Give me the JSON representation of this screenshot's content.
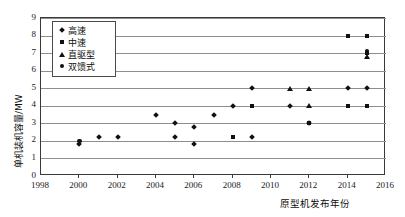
{
  "chart_data": {
    "type": "scatter",
    "title": "",
    "xlabel": "原型机发布年份",
    "ylabel": "单机装机容量/MW",
    "xlim": [
      1998,
      2016
    ],
    "ylim": [
      0,
      9
    ],
    "xticks": [
      1998,
      2000,
      2002,
      2004,
      2006,
      2008,
      2010,
      2012,
      2014,
      2016
    ],
    "yticks": [
      0,
      1,
      2,
      3,
      4,
      5,
      6,
      7,
      8,
      9
    ],
    "grid": true,
    "legend_position": "top-left",
    "series": [
      {
        "name": "高速",
        "marker": "diamond",
        "points": [
          {
            "x": 2000,
            "y": 1.8
          },
          {
            "x": 2001,
            "y": 2.2
          },
          {
            "x": 2002,
            "y": 2.2
          },
          {
            "x": 2004,
            "y": 3.5
          },
          {
            "x": 2005,
            "y": 3.0
          },
          {
            "x": 2005,
            "y": 2.2
          },
          {
            "x": 2006,
            "y": 2.8
          },
          {
            "x": 2006,
            "y": 1.8
          },
          {
            "x": 2007,
            "y": 3.5
          },
          {
            "x": 2008,
            "y": 4.0
          },
          {
            "x": 2009,
            "y": 5.0
          },
          {
            "x": 2009,
            "y": 2.2
          },
          {
            "x": 2011,
            "y": 4.0
          },
          {
            "x": 2012,
            "y": 3.0
          },
          {
            "x": 2014,
            "y": 5.0
          },
          {
            "x": 2015,
            "y": 5.0
          }
        ]
      },
      {
        "name": "中速",
        "marker": "square",
        "points": [
          {
            "x": 2008,
            "y": 2.2
          },
          {
            "x": 2009,
            "y": 4.0
          },
          {
            "x": 2012,
            "y": 3.0
          },
          {
            "x": 2014,
            "y": 4.0
          },
          {
            "x": 2014,
            "y": 8.0
          },
          {
            "x": 2015,
            "y": 4.0
          },
          {
            "x": 2015,
            "y": 8.0
          },
          {
            "x": 2015,
            "y": 7.0
          }
        ]
      },
      {
        "name": "直驱型",
        "marker": "triangle",
        "points": [
          {
            "x": 2011,
            "y": 5.0
          },
          {
            "x": 2012,
            "y": 5.0
          },
          {
            "x": 2012,
            "y": 4.0
          },
          {
            "x": 2015,
            "y": 6.8
          }
        ]
      },
      {
        "name": "双馈式",
        "marker": "circle",
        "points": [
          {
            "x": 2000,
            "y": 2.0
          },
          {
            "x": 2015,
            "y": 7.1
          }
        ]
      }
    ]
  },
  "axis": {
    "y_tick_labels": [
      "9",
      "8",
      "7",
      "6",
      "5",
      "4",
      "3",
      "2",
      "1",
      "0"
    ],
    "x_tick_labels": [
      "1998",
      "2000",
      "2002",
      "2004",
      "2006",
      "2008",
      "2010",
      "2012",
      "2014",
      "2016"
    ]
  },
  "legend": {
    "items": [
      {
        "label": "高速",
        "marker": "diamond"
      },
      {
        "label": "中速",
        "marker": "square"
      },
      {
        "label": "直驱型",
        "marker": "triangle"
      },
      {
        "label": "双馈式",
        "marker": "circle"
      }
    ]
  },
  "colors": {
    "marker": "#111111",
    "gridline": "#8e8e8e",
    "frame": "#3a3a3a",
    "background": "#ffffff"
  }
}
